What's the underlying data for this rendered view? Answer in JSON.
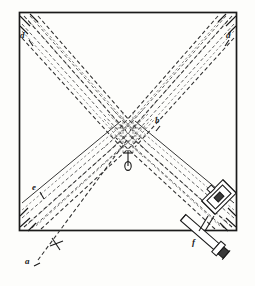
{
  "figure": {
    "type": "optical-ray-diagram",
    "background_color": "#fdfdfb",
    "ink_color": "#1a1a1a",
    "ray_color": "#3a3a3a",
    "canvas": {
      "width": 255,
      "height": 286
    }
  },
  "plate": {
    "name": "square-plate",
    "x": 19,
    "y": 12,
    "width": 218,
    "height": 219,
    "stroke_color": "#1a1a1a",
    "stroke_width": 1.6
  },
  "labels": [
    {
      "id": "label-d-left",
      "text": "d",
      "x": 21,
      "y": 36,
      "target": "upper-left-corner-beam-bundle"
    },
    {
      "id": "label-d-right",
      "text": "d",
      "x": 226,
      "y": 36,
      "target": "upper-right-corner-beam-bundle"
    },
    {
      "id": "label-b",
      "text": "b",
      "x": 155,
      "y": 121,
      "target": "central-crossing-point"
    },
    {
      "id": "label-e",
      "text": "e",
      "x": 33,
      "y": 188,
      "target": "lower-left-beam-bundle"
    },
    {
      "id": "label-f",
      "text": "f",
      "x": 193,
      "y": 243,
      "target": "collimator-tube"
    },
    {
      "id": "label-a",
      "text": "a",
      "x": 26,
      "y": 262,
      "target": "incoming-source-ray"
    }
  ],
  "optical_elements": [
    {
      "name": "mirror-box",
      "description": "rectangular mirror / prism holder at lower right",
      "cx": 219,
      "cy": 197,
      "w": 26,
      "h": 17,
      "angle": -45
    },
    {
      "name": "collimator-tube",
      "description": "cylindrical collimating tube with end flange",
      "x1": 183,
      "y1": 218,
      "x2": 222,
      "y2": 252,
      "thickness": 7
    },
    {
      "name": "source-pinhole",
      "description": "small pin / source marker below centre",
      "cx": 128,
      "cy": 160
    },
    {
      "name": "cross-mark-a",
      "description": "small cross on the incoming ray a",
      "cx": 56,
      "cy": 244
    }
  ],
  "ray_bundles": [
    {
      "name": "bundle-upper-left",
      "from": "centre",
      "to": "upper-left-corner",
      "count": 6,
      "style": "dashed"
    },
    {
      "name": "bundle-upper-right",
      "from": "centre",
      "to": "upper-right-corner",
      "count": 6,
      "style": "dashed"
    },
    {
      "name": "bundle-lower-left",
      "from": "centre",
      "to": "lower-left-corner",
      "count": 6,
      "style": "dashed"
    },
    {
      "name": "bundle-lower-right",
      "from": "centre",
      "to": "lower-right-corner",
      "count": 6,
      "style": "dashed"
    },
    {
      "name": "ray-a-incoming",
      "from": "a",
      "to": "centre",
      "count": 1,
      "style": "dashed-long"
    }
  ],
  "centre_point": {
    "x": 127,
    "y": 133
  }
}
